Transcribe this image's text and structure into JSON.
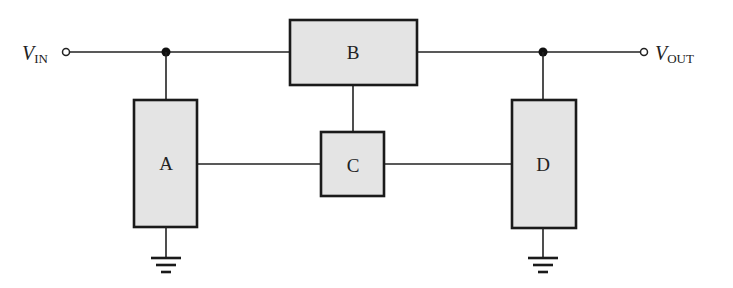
{
  "diagram": {
    "terminals": {
      "input": {
        "main": "V",
        "sub": "IN"
      },
      "output": {
        "main": "V",
        "sub": "OUT"
      }
    },
    "blocks": [
      {
        "id": "A",
        "label": "A"
      },
      {
        "id": "B",
        "label": "B"
      },
      {
        "id": "C",
        "label": "C"
      },
      {
        "id": "D",
        "label": "D"
      }
    ],
    "colors": {
      "block_fill": "#e4e4e4",
      "stroke": "#1a1a1a"
    }
  }
}
